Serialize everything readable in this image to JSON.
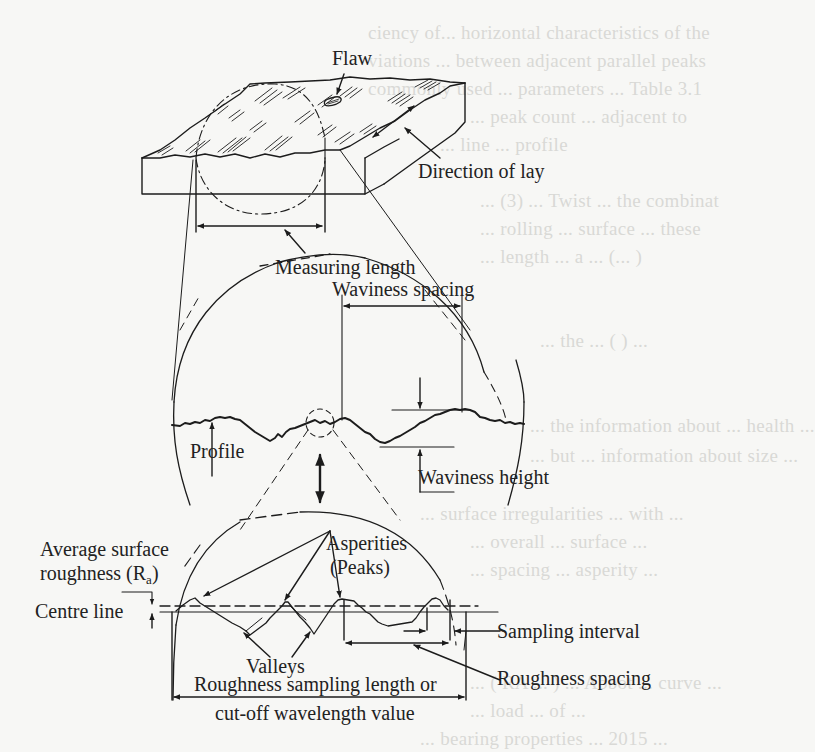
{
  "figure": {
    "labels": {
      "flaw": "Flaw",
      "direction_of_lay": "Direction of lay",
      "measuring_length": "Measuring length",
      "waviness_spacing": "Waviness spacing",
      "profile": "Profile",
      "waviness_height": "Waviness height",
      "asperities": "Asperities",
      "peaks": "(Peaks)",
      "average_surface": "Average surface",
      "roughness_ra_prefix": "roughness (R",
      "roughness_ra_sub": "a",
      "roughness_ra_suffix": ")",
      "centre_line": "Centre line",
      "sampling_interval": "Sampling interval",
      "valleys": "Valleys",
      "roughness_spacing": "Roughness spacing",
      "sampling_length_line1": "Roughness sampling length or",
      "sampling_length_line2": "cut-off wavelength value"
    },
    "colors": {
      "ink": "#1c1c1c",
      "paper": "#f7f7f5",
      "faint_text": "#d9d9d6"
    }
  },
  "background_text": {
    "lines": [
      "ciency of... horizontal characteristics of the",
      "viations ... between adjacent parallel peaks",
      "commonly used ... parameters ... Table 3.1",
      "... peak count ... adjacent to",
      "... line ... profile",
      "... (3) ... Twist ... the combinat",
      "... rolling ... surface ... these",
      "... length ... a ... (... )",
      "... ",
      "... the ... ( ) ...",
      "... the information about ... health ... ",
      "... but ... information about size ...",
      "... surface irregularities ... with ...",
      "... overall ... surface ...",
      "... spacing ... asperity ...",
      "... ",
      "... ( RA ... ) ... Abbot ... curve ... ",
      "... load ... of ... ",
      "... bearing properties ... 2015 ..."
    ]
  }
}
